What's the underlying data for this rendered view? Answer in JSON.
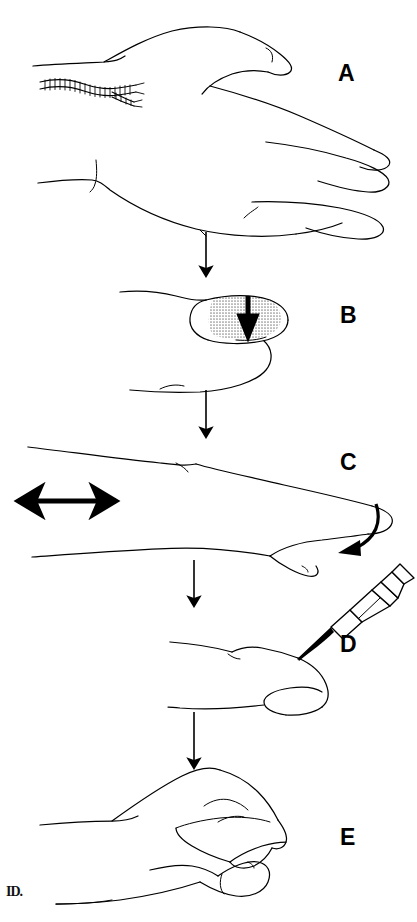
{
  "figure": {
    "type": "medical line-art illustration",
    "background_color": "#ffffff",
    "ink_color": "#000000",
    "shade_color": "#c9c9c9",
    "panel_count": 5,
    "flow_direction": "top-to-bottom",
    "signature": "ID."
  },
  "panels": [
    {
      "id": "A",
      "label": "A",
      "caption": "Lateral view of hand and wrist showing a sutured laceration over the volar wrist",
      "annotations": [
        "sutured-wound",
        "hand-lateral-view"
      ]
    },
    {
      "id": "B",
      "label": "B",
      "caption": "Fingertip pulp with shaded distal zone; vertical arrow indicates applied pressure",
      "annotations": [
        "shaded-pulp-region",
        "pressure-arrow"
      ]
    },
    {
      "id": "C",
      "label": "C",
      "caption": "Extended finger with double-headed arrow showing side-to-side motion and curved arrow showing flexion direction",
      "annotations": [
        "double-headed-arrow",
        "curved-motion-arrow"
      ]
    },
    {
      "id": "D",
      "label": "D",
      "caption": "Syringe with needle inserted at the dorsal fingertip",
      "annotations": [
        "syringe",
        "needle-insertion"
      ]
    },
    {
      "id": "E",
      "label": "E",
      "caption": "Finger held in flexed position after the procedure",
      "annotations": [
        "flexed-finger"
      ]
    }
  ],
  "connectors": [
    {
      "id": "arrow-a-to-b",
      "from": "A",
      "to": "B",
      "style": "straight-down"
    },
    {
      "id": "arrow-b-to-c",
      "from": "B",
      "to": "C",
      "style": "straight-down"
    },
    {
      "id": "arrow-c-to-d",
      "from": "C",
      "to": "D",
      "style": "straight-down"
    },
    {
      "id": "arrow-d-to-e",
      "from": "D",
      "to": "E",
      "style": "straight-down"
    }
  ]
}
